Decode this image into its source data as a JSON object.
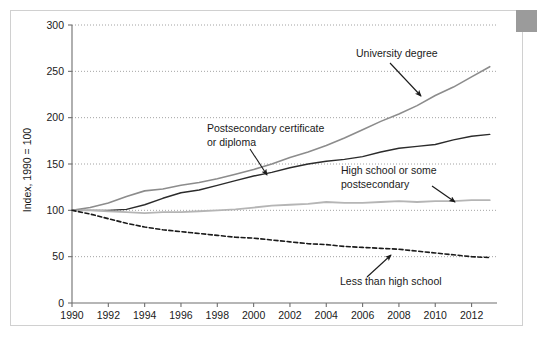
{
  "chart_data": {
    "type": "line",
    "title": "",
    "subtitle": "",
    "xlabel": "",
    "ylabel": "Index, 1990 = 100",
    "xlim": [
      1990,
      2013.4
    ],
    "ylim": [
      0,
      300
    ],
    "grid": true,
    "legend_position": "inline-annotations",
    "x_ticks": [
      "1990",
      "1992",
      "1994",
      "1996",
      "1998",
      "2000",
      "2002",
      "2004",
      "2006",
      "2008",
      "2010",
      "2012"
    ],
    "y_ticks": [
      "0",
      "50",
      "100",
      "150",
      "200",
      "250",
      "300"
    ],
    "x": [
      1990,
      1991,
      1992,
      1993,
      1994,
      1995,
      1996,
      1997,
      1998,
      1999,
      2000,
      2001,
      2002,
      2003,
      2004,
      2005,
      2006,
      2007,
      2008,
      2009,
      2010,
      2011,
      2012,
      2013
    ],
    "series": [
      {
        "name": "University degree",
        "color": "#8c8c8c",
        "style": "solid",
        "width": 1.6,
        "values": [
          100,
          103,
          108,
          115,
          121,
          123,
          127,
          130,
          134,
          139,
          144,
          150,
          157,
          163,
          170,
          178,
          187,
          196,
          204,
          213,
          224,
          233,
          244,
          255
        ]
      },
      {
        "name": "Postsecondary certificate or diploma",
        "color": "#2b2b2b",
        "style": "solid",
        "width": 1.4,
        "values": [
          100,
          100,
          100,
          101,
          106,
          113,
          119,
          122,
          127,
          132,
          137,
          141,
          146,
          150,
          153,
          155,
          158,
          163,
          167,
          169,
          171,
          176,
          180,
          182
        ]
      },
      {
        "name": "High school or some postsecondary",
        "color": "#b5b5b5",
        "style": "solid",
        "width": 1.8,
        "values": [
          100,
          100,
          99,
          98,
          97,
          98,
          98,
          99,
          100,
          101,
          103,
          105,
          106,
          107,
          109,
          108,
          108,
          109,
          110,
          109,
          110,
          110,
          111,
          111
        ]
      },
      {
        "name": "Less than high school",
        "color": "#1a1a1a",
        "style": "dashed",
        "width": 1.6,
        "values": [
          100,
          96,
          91,
          86,
          82,
          79,
          77,
          75,
          73,
          71,
          70,
          68,
          66,
          64,
          63,
          61,
          60,
          59,
          58,
          56,
          54,
          52,
          50,
          49
        ]
      }
    ],
    "annotations": [
      {
        "name": "university-degree",
        "lines": [
          "University degree"
        ],
        "text_x": 356,
        "text_y": 57,
        "arrow_from_x": 390,
        "arrow_from_y": 63,
        "arrow_to_x": 421,
        "arrow_to_y": 96
      },
      {
        "name": "postsecondary-certificate",
        "lines": [
          "Postsecondary certificate",
          "or diploma"
        ],
        "text_x": 207,
        "text_y": 132,
        "arrow_from_x": 250,
        "arrow_from_y": 149,
        "arrow_to_x": 267,
        "arrow_to_y": 175
      },
      {
        "name": "high-school-or-some-postsecondary",
        "lines": [
          "High school or some",
          "postsecondary"
        ],
        "text_x": 341,
        "text_y": 174,
        "arrow_from_x": 432,
        "arrow_from_y": 186,
        "arrow_to_x": 455,
        "arrow_to_y": 202
      },
      {
        "name": "less-than-high-school",
        "lines": [
          "Less than high school"
        ],
        "text_x": 340,
        "text_y": 285,
        "arrow_from_x": 367,
        "arrow_from_y": 277,
        "arrow_to_x": 391,
        "arrow_to_y": 255
      }
    ]
  },
  "figure": {
    "border_color": "#d0d0d0",
    "corner_block_color": "#9b9b9b",
    "background": "#ffffff",
    "gridline_color": "#8c8c8c",
    "axis_color": "#6e6e6e"
  }
}
